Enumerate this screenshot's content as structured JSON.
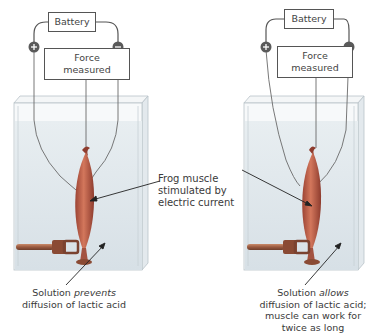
{
  "diagram": {
    "top_fragment": "g … pp … g … y",
    "left_setup": {
      "battery_label": "Battery",
      "positive_terminal": "+",
      "negative_terminal": "−",
      "force_label_line1": "Force",
      "force_label_line2": "measured",
      "caption_prefix": "Solution ",
      "caption_emphasis": "prevents",
      "caption_line2": "diffusion of lactic acid"
    },
    "right_setup": {
      "battery_label": "Battery",
      "positive_terminal": "+",
      "negative_terminal": "−",
      "force_label_line1": "Force",
      "force_label_line2": "measured",
      "caption_prefix": "Solution ",
      "caption_emphasis": "allows",
      "caption_line2": "diffusion of lactic acid;",
      "caption_line3": "muscle can work for",
      "caption_line4": "twice as long"
    },
    "center_label": {
      "line1": "Frog muscle",
      "line2": "stimulated by",
      "line3": "electric current"
    },
    "colors": {
      "tank_fill": "#dfe7ec",
      "tank_edge": "#b9c3c9",
      "muscle": "#c0604a",
      "wire": "#555555",
      "terminal": "#5a5a5a"
    }
  }
}
